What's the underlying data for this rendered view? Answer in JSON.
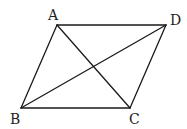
{
  "diagram": {
    "type": "parallelogram-with-diagonals",
    "line_color": "#1a1a1a",
    "label_color": "#222222",
    "vertices": {
      "A": {
        "label": "A",
        "x": 57,
        "y": 25,
        "lx": 48,
        "ly": 20
      },
      "B": {
        "label": "B",
        "x": 21,
        "y": 108,
        "lx": 10,
        "ly": 124
      },
      "C": {
        "label": "C",
        "x": 130,
        "y": 108,
        "lx": 129,
        "ly": 124
      },
      "D": {
        "label": "D",
        "x": 166,
        "y": 25,
        "lx": 170,
        "ly": 25
      }
    },
    "edges": [
      {
        "name": "side-AD",
        "from": "A",
        "to": "D"
      },
      {
        "name": "side-DC",
        "from": "D",
        "to": "C"
      },
      {
        "name": "side-CB",
        "from": "C",
        "to": "B"
      },
      {
        "name": "side-BA",
        "from": "B",
        "to": "A"
      },
      {
        "name": "diagonal-AC",
        "from": "A",
        "to": "C"
      },
      {
        "name": "diagonal-BD",
        "from": "B",
        "to": "D"
      }
    ]
  }
}
